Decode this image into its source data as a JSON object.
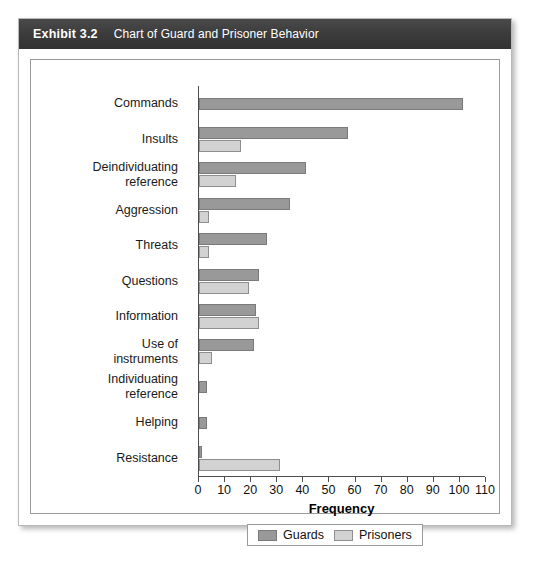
{
  "exhibit": {
    "number": "Exhibit 3.2",
    "title": "Chart of Guard and Prisoner Behavior",
    "header_bg": "#3a3a3a",
    "header_fg": "#ffffff"
  },
  "legend": {
    "position": "bottom-center",
    "items": [
      {
        "label": "Guards",
        "color": "#999999"
      },
      {
        "label": "Prisoners",
        "color": "#d2d2d2"
      }
    ]
  },
  "axis": {
    "x_title": "Frequency",
    "tick_labels": [
      "0",
      "10",
      "20",
      "30",
      "40",
      "50",
      "60",
      "70",
      "80",
      "90",
      "100",
      "110"
    ]
  },
  "chart_data": {
    "type": "bar",
    "orientation": "horizontal",
    "title": "Chart of Guard and Prisoner Behavior",
    "xlabel": "Frequency",
    "ylabel": "",
    "xlim": [
      0,
      110
    ],
    "xticks": [
      0,
      10,
      20,
      30,
      40,
      50,
      60,
      70,
      80,
      90,
      100,
      110
    ],
    "grid": false,
    "legend_position": "bottom-center",
    "categories": [
      "Commands",
      "Insults",
      "Deindividuating reference",
      "Aggression",
      "Threats",
      "Questions",
      "Information",
      "Use of instruments",
      "Individuating reference",
      "Helping",
      "Resistance"
    ],
    "category_lines": [
      [
        "Commands"
      ],
      [
        "Insults"
      ],
      [
        "Deindividuating",
        "reference"
      ],
      [
        "Aggression"
      ],
      [
        "Threats"
      ],
      [
        "Questions"
      ],
      [
        "Information"
      ],
      [
        "Use of",
        "instruments"
      ],
      [
        "Individuating",
        "reference"
      ],
      [
        "Helping"
      ],
      [
        "Resistance"
      ]
    ],
    "series": [
      {
        "name": "Guards",
        "color": "#999999",
        "values": [
          101,
          57,
          41,
          35,
          26,
          23,
          22,
          21,
          3,
          3,
          1
        ]
      },
      {
        "name": "Prisoners",
        "color": "#d2d2d2",
        "values": [
          0,
          16,
          14,
          4,
          4,
          19,
          23,
          5,
          0,
          0,
          31
        ]
      }
    ]
  }
}
